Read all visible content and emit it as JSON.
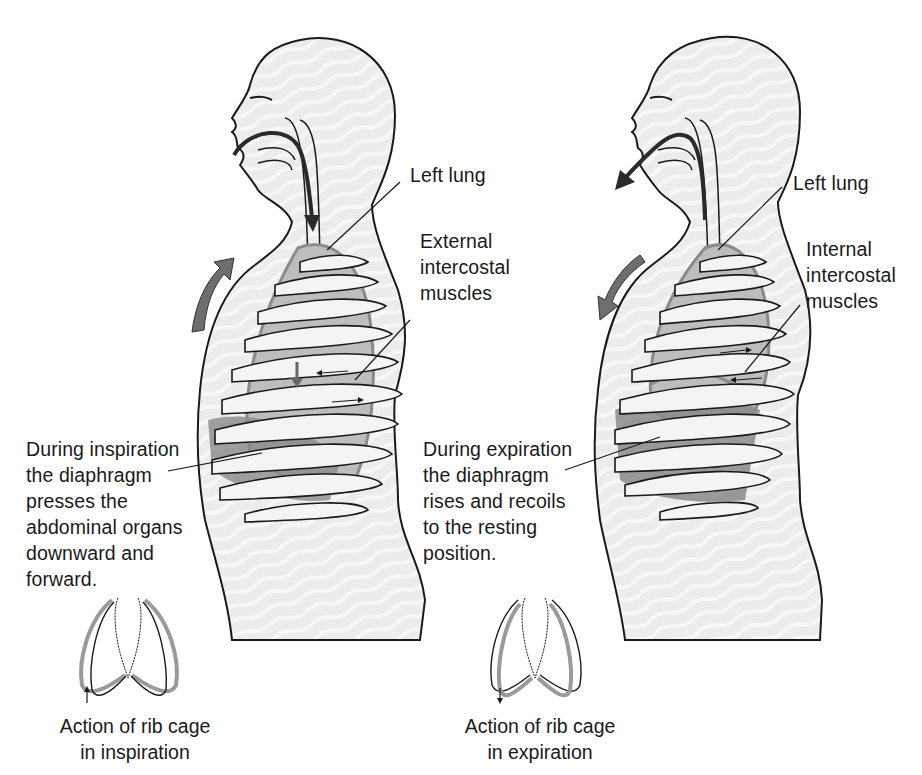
{
  "figure": {
    "panels": [
      {
        "id": "inspiration",
        "labels": {
          "lung": "Left lung",
          "muscles": "External\nintercostal\nmuscles",
          "diaphragm": "During inspiration\nthe diaphragm\npresses the\nabdominal organs\ndownward and\nforward.",
          "rib_cage_caption": "Action of rib cage\nin inspiration"
        },
        "airflow_direction": "inward",
        "chest_movement": "upward-outward"
      },
      {
        "id": "expiration",
        "labels": {
          "lung": "Left lung",
          "muscles": "Internal\nintercostal\nmuscles",
          "diaphragm": "During expiration\nthe diaphragm\nrises and recoils\nto the resting\nposition.",
          "rib_cage_caption": "Action of rib cage\nin expiration"
        },
        "airflow_direction": "outward",
        "chest_movement": "downward-inward"
      }
    ],
    "colors": {
      "outline": "#1a1a1a",
      "body_fill": "#ececec",
      "lung_fill": "#bdbdbd",
      "rib_fill": "#f4f4f4",
      "arrow_fill": "#6e6e6e",
      "muscle_fill": "#8a8a8a",
      "rib_cage_gray": "#9a9a9a"
    }
  }
}
